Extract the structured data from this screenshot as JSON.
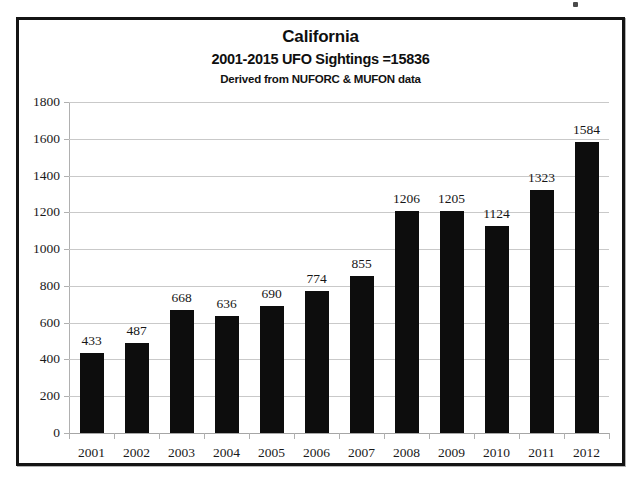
{
  "chart_data": {
    "type": "bar",
    "title": "California",
    "subtitle": "2001-2015 UFO Sightings =15836",
    "source_note": "Derived from NUFORC & MUFON data",
    "xlabel": "",
    "ylabel": "",
    "categories": [
      "2001",
      "2002",
      "2003",
      "2004",
      "2005",
      "2006",
      "2007",
      "2008",
      "2009",
      "2010",
      "2011",
      "2012"
    ],
    "values": [
      433,
      487,
      668,
      636,
      690,
      774,
      855,
      1206,
      1205,
      1124,
      1323,
      1584
    ],
    "ylim": [
      0,
      1800
    ],
    "ytick_values": [
      0,
      200,
      400,
      600,
      800,
      1000,
      1200,
      1400,
      1600,
      1800
    ],
    "ytick_labels": [
      "0",
      "200",
      "400",
      "600",
      "800",
      "1000",
      "1200",
      "1400",
      "1600",
      "1800"
    ],
    "data_labels": [
      "433",
      "487",
      "668",
      "636",
      "690",
      "774",
      "855",
      "1206",
      "1205",
      "1124",
      "1323",
      "1584"
    ],
    "grid": true,
    "legend": false,
    "bar_color": "#0d0d0d",
    "grid_color": "#c9c9c9",
    "background_color": "#ffffff",
    "frame_color": "#141414"
  }
}
